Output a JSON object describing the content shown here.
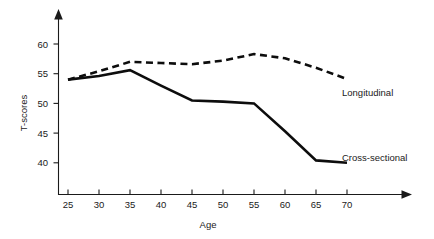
{
  "chart_data": {
    "type": "line",
    "title": "",
    "xlabel": "Age",
    "ylabel": "T-scores",
    "x": [
      25,
      30,
      35,
      40,
      45,
      50,
      55,
      60,
      65,
      70
    ],
    "xlim": [
      23,
      73
    ],
    "ylim": [
      38,
      62.5
    ],
    "grid": false,
    "legend_position": "inline-right",
    "xticks": [
      "25",
      "30",
      "35",
      "40",
      "45",
      "50",
      "55",
      "60",
      "65",
      "70"
    ],
    "yticks": [
      "40",
      "45",
      "50",
      "55",
      "60"
    ],
    "ytick_values": [
      40,
      45,
      50,
      55,
      60
    ],
    "xtick_values": [
      25,
      30,
      35,
      40,
      45,
      50,
      55,
      60,
      65,
      70
    ],
    "series": [
      {
        "name": "Longitudinal",
        "style": "dashed",
        "color": "#0d0d0d",
        "values": [
          54.0,
          55.4,
          57.0,
          56.8,
          56.6,
          57.2,
          58.3,
          57.6,
          56.0,
          54.1
        ]
      },
      {
        "name": "Cross-sectional",
        "style": "solid",
        "color": "#0d0d0d",
        "values": [
          54.0,
          54.6,
          55.6,
          53.0,
          50.5,
          50.3,
          50.0,
          45.3,
          40.4,
          40.0
        ]
      }
    ],
    "annotations": [
      {
        "text": "Longitudinal",
        "x": 62.5,
        "y": 52.6
      },
      {
        "text": "Cross-sectional",
        "x": 60.5,
        "y": 43.6
      }
    ],
    "axis_style": {
      "x_arrow": true,
      "y_arrow": true,
      "axis_color": "#1a1a1a"
    }
  }
}
